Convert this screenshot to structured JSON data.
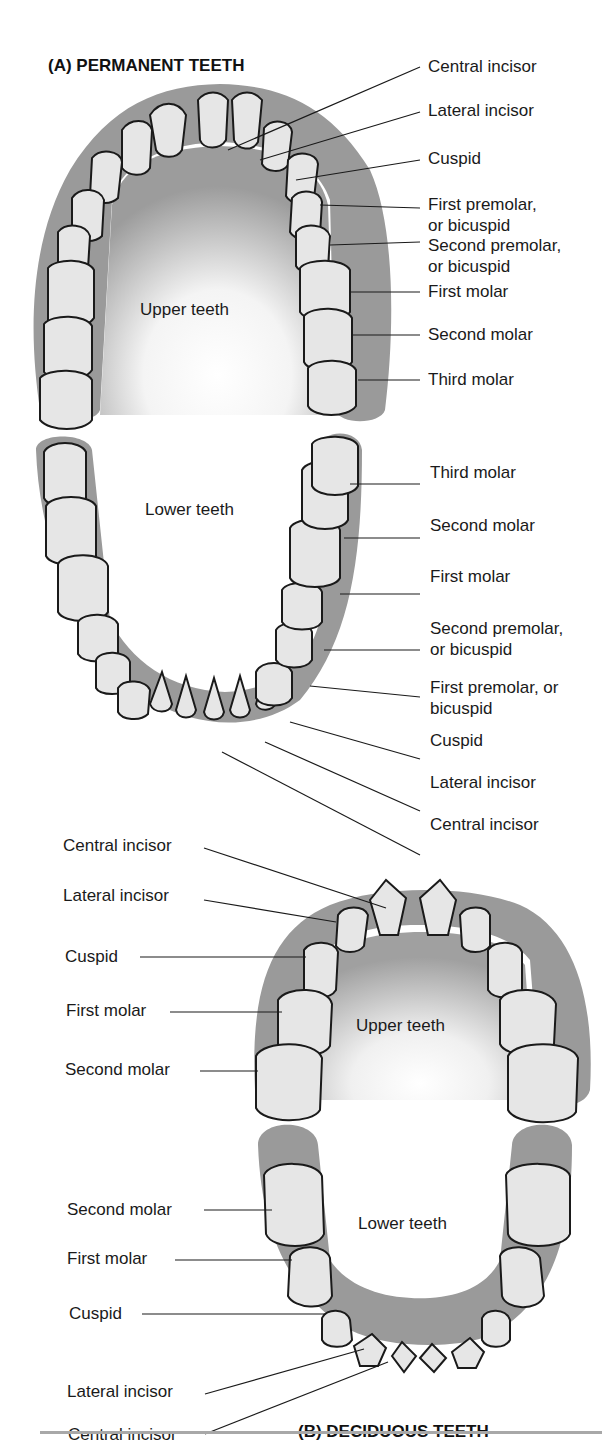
{
  "permanent": {
    "title": "(A) PERMANENT TEETH",
    "upper_region": "Upper teeth",
    "lower_region": "Lower teeth",
    "upper_labels": [
      {
        "text": "Central incisor"
      },
      {
        "text": "Lateral incisor"
      },
      {
        "text": "Cuspid"
      },
      {
        "text": "First premolar,",
        "text2": "or bicuspid"
      },
      {
        "text": "Second premolar,",
        "text2": "or bicuspid"
      },
      {
        "text": "First molar"
      },
      {
        "text": "Second molar"
      },
      {
        "text": "Third molar"
      }
    ],
    "lower_labels": [
      {
        "text": "Third molar"
      },
      {
        "text": "Second molar"
      },
      {
        "text": "First molar"
      },
      {
        "text": "Second premolar,",
        "text2": "or bicuspid"
      },
      {
        "text": "First premolar, or",
        "text2": "bicuspid"
      },
      {
        "text": "Cuspid"
      },
      {
        "text": "Lateral incisor"
      },
      {
        "text": "Central incisor"
      }
    ]
  },
  "deciduous": {
    "title": "(B) DECIDUOUS TEETH",
    "upper_region": "Upper teeth",
    "lower_region": "Lower teeth",
    "upper_labels": [
      {
        "text": "Central incisor"
      },
      {
        "text": "Lateral incisor"
      },
      {
        "text": "Cuspid"
      },
      {
        "text": "First molar"
      },
      {
        "text": "Second molar"
      }
    ],
    "lower_labels": [
      {
        "text": "Second molar"
      },
      {
        "text": "First molar"
      },
      {
        "text": "Cuspid"
      },
      {
        "text": "Lateral incisor"
      },
      {
        "text": "Central incisor"
      }
    ]
  },
  "colors": {
    "gum": "#9a9a9a",
    "gum_light": "#b8b8b8",
    "tooth": "#e6e6e6",
    "outline": "#1a1a1a",
    "rule": "#a8a8a8"
  }
}
